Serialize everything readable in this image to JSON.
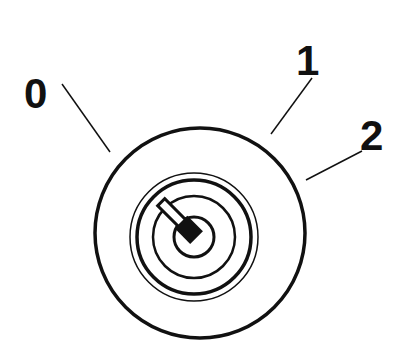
{
  "diagram": {
    "positions": [
      {
        "label": "0",
        "x": 45,
        "y": 108
      },
      {
        "label": "1",
        "x": 313,
        "y": 75
      },
      {
        "label": "2",
        "x": 378,
        "y": 150
      }
    ],
    "colors": {
      "ink": "#111111",
      "background": "#ffffff"
    }
  }
}
